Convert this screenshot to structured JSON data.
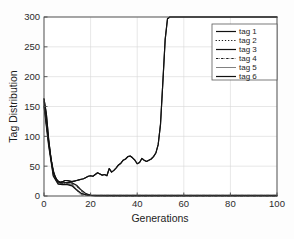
{
  "chart_data": {
    "type": "line",
    "title": "",
    "xlabel": "Generations",
    "ylabel": "Tag Distribution",
    "xlim": [
      0,
      100
    ],
    "ylim": [
      0,
      300
    ],
    "xticks": [
      0,
      20,
      40,
      60,
      80,
      100
    ],
    "yticks": [
      0,
      50,
      100,
      150,
      200,
      250,
      300
    ],
    "xtick_labels": [
      "0",
      "20",
      "40",
      "60",
      "80",
      "100"
    ],
    "ytick_labels": [
      "0",
      "50",
      "100",
      "150",
      "200",
      "250",
      "300"
    ],
    "grid": true,
    "legend_position": "upper right",
    "legend_entries": [
      "tag 1",
      "tag 2",
      "tag 3",
      "tag 4",
      "tag 5",
      "tag 6"
    ],
    "series": [
      {
        "name": "tag 1",
        "style": "solid",
        "x": [
          0,
          1,
          2,
          3,
          4,
          5,
          6,
          7,
          8,
          9,
          10,
          11,
          12,
          13,
          14,
          15,
          16,
          17,
          18,
          19,
          20,
          21,
          22,
          23,
          24,
          25,
          26,
          27,
          28,
          29,
          30,
          31,
          32,
          33,
          34,
          35,
          36,
          37,
          38,
          39,
          40,
          41,
          42,
          43,
          44,
          45,
          46,
          47,
          48,
          49,
          50,
          51,
          52,
          53,
          54,
          56,
          58,
          60,
          65,
          70,
          75,
          80,
          85,
          90,
          95,
          100
        ],
        "y": [
          163,
          138,
          95,
          62,
          42,
          30,
          25,
          23,
          24,
          26,
          26,
          25,
          24,
          25,
          26,
          27,
          28,
          29,
          31,
          33,
          34,
          33,
          36,
          39,
          37,
          35,
          36,
          34,
          46,
          40,
          43,
          47,
          52,
          55,
          60,
          62,
          66,
          67,
          64,
          60,
          54,
          56,
          63,
          60,
          58,
          60,
          62,
          66,
          72,
          86,
          120,
          190,
          262,
          297,
          300,
          300,
          300,
          300,
          300,
          300,
          300,
          300,
          300,
          300,
          300,
          300
        ]
      },
      {
        "name": "tag 2",
        "style": "dotted",
        "x": [
          0,
          2,
          4,
          6,
          8,
          10,
          12,
          14,
          16,
          18,
          20,
          30,
          40,
          50,
          60,
          70,
          80,
          90,
          100
        ],
        "y": [
          160,
          92,
          40,
          24,
          22,
          22,
          20,
          16,
          8,
          3,
          1,
          0,
          0,
          0,
          0,
          0,
          0,
          0,
          0
        ]
      },
      {
        "name": "tag 3",
        "style": "solid-thick",
        "x": [
          0,
          2,
          4,
          6,
          8,
          10,
          12,
          14,
          16,
          18,
          20,
          22,
          24,
          26,
          28,
          30,
          40,
          50,
          60,
          80,
          100
        ],
        "y": [
          158,
          90,
          38,
          23,
          22,
          23,
          22,
          18,
          10,
          4,
          1,
          0,
          0,
          0,
          0,
          0,
          0,
          0,
          0,
          0,
          0
        ]
      },
      {
        "name": "tag 4",
        "style": "dash-dot",
        "x": [
          0,
          2,
          4,
          6,
          8,
          10,
          12,
          14,
          15,
          16,
          18,
          20,
          25,
          30,
          40,
          50,
          60,
          70,
          80,
          90,
          100
        ],
        "y": [
          155,
          88,
          36,
          22,
          21,
          21,
          19,
          12,
          4,
          2,
          1,
          1,
          1,
          1,
          1,
          1,
          1,
          1,
          1,
          1,
          1
        ]
      },
      {
        "name": "tag 5",
        "style": "thin-solid",
        "x": [
          0,
          2,
          4,
          6,
          8,
          10,
          12,
          14,
          16,
          18,
          20,
          30,
          40,
          50,
          60,
          70,
          80,
          90,
          100
        ],
        "y": [
          152,
          86,
          34,
          21,
          20,
          20,
          18,
          11,
          5,
          2,
          1,
          1,
          1,
          1,
          1,
          1,
          1,
          1,
          1
        ]
      },
      {
        "name": "tag 6",
        "style": "solid",
        "x": [
          0,
          2,
          4,
          6,
          8,
          10,
          12,
          14,
          16,
          18,
          20,
          30,
          40,
          50,
          60,
          70,
          80,
          90,
          100
        ],
        "y": [
          150,
          84,
          33,
          20,
          19,
          19,
          17,
          10,
          4,
          2,
          1,
          1,
          1,
          1,
          1,
          1,
          1,
          1,
          1
        ]
      }
    ]
  },
  "axes": {
    "xlabel": "Generations",
    "ylabel": "Tag Distribution",
    "xtick0": "0",
    "xtick1": "20",
    "xtick2": "40",
    "xtick3": "60",
    "xtick4": "80",
    "xtick5": "100",
    "ytick0": "0",
    "ytick1": "50",
    "ytick2": "100",
    "ytick3": "150",
    "ytick4": "200",
    "ytick5": "250",
    "ytick6": "300"
  },
  "legend": {
    "items": [
      {
        "label": "tag 1"
      },
      {
        "label": "tag 2"
      },
      {
        "label": "tag 3"
      },
      {
        "label": "tag 4"
      },
      {
        "label": "tag 5"
      },
      {
        "label": "tag 6"
      }
    ]
  },
  "colors": {
    "line": "#111111",
    "frame": "#4a4a4a",
    "grid": "#d6d6d6",
    "background": "#fdfdfd"
  }
}
